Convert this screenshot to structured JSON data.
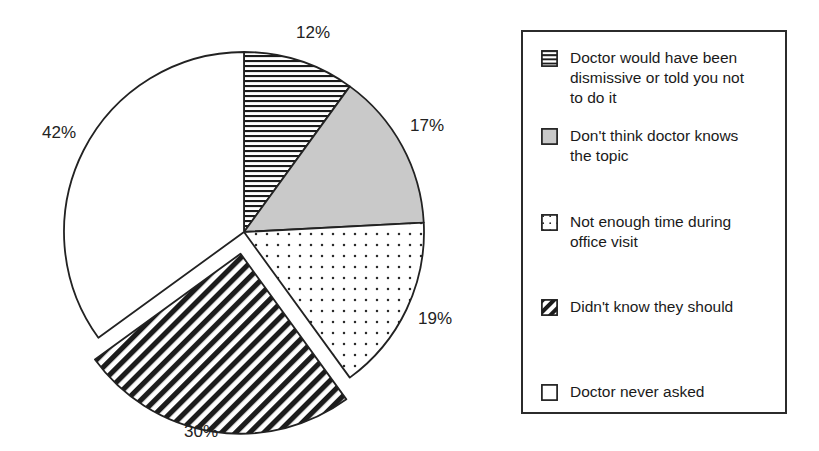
{
  "chart_data": {
    "type": "pie",
    "title": "",
    "subtitle": "",
    "xlabel": "",
    "ylabel": "",
    "grid": false,
    "legend_position": "right",
    "start_angle_deg": 0,
    "direction": "clockwise",
    "center": {
      "x": 244,
      "y": 232
    },
    "radius": 180,
    "categories": [
      "Doctor would have been dismissive or told you not to do it",
      "Don't think doctor knows the topic",
      "Not enough time during office visit",
      "Didn't know  they should",
      "Doctor never asked"
    ],
    "values": [
      12,
      17,
      19,
      30,
      42
    ],
    "value_labels": [
      "12%",
      "17%",
      "19%",
      "30%",
      "42%"
    ],
    "slices": [
      {
        "label": "12%",
        "value": 12,
        "pattern": "horizontal-lines",
        "fill": "#ffffff",
        "stroke": "#222222",
        "exploded": false,
        "label_x": 296,
        "label_y": 24
      },
      {
        "label": "17%",
        "value": 17,
        "pattern": "solid-gray",
        "fill": "#c9c9c9",
        "stroke": "#222222",
        "exploded": false,
        "label_x": 410,
        "label_y": 117
      },
      {
        "label": "19%",
        "value": 19,
        "pattern": "dots",
        "fill": "#ffffff",
        "stroke": "#222222",
        "exploded": false,
        "label_x": 418,
        "label_y": 310
      },
      {
        "label": "30%",
        "value": 30,
        "pattern": "diagonal-hatch",
        "fill": "#ffffff",
        "stroke": "#222222",
        "exploded": true,
        "label_x": 184,
        "label_y": 423
      },
      {
        "label": "42%",
        "value": 42,
        "pattern": "none",
        "fill": "#ffffff",
        "stroke": "#222222",
        "exploded": false,
        "label_x": 42,
        "label_y": 124
      }
    ]
  },
  "legend": {
    "border_color": "#2b2b2b",
    "background": "#ffffff",
    "items": [
      {
        "swatch": "horizontal-lines-swatch",
        "label": "Doctor would have been\ndismissive or told you not\nto do it",
        "top": 16
      },
      {
        "swatch": "solid-gray-swatch",
        "label": "Don't think doctor knows\nthe topic",
        "top": 94
      },
      {
        "swatch": "dots-swatch",
        "label": "Not enough time during\noffice visit",
        "top": 180
      },
      {
        "swatch": "diagonal-hatch-swatch",
        "label": "Didn't know  they should",
        "top": 265
      },
      {
        "swatch": "empty-white-swatch",
        "label": "Doctor never asked",
        "top": 350
      }
    ]
  }
}
